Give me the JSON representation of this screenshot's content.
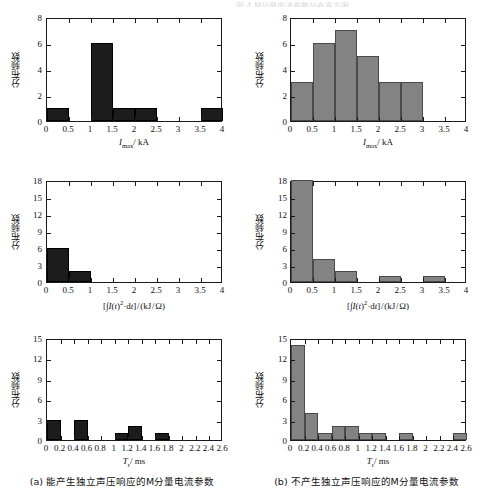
{
  "figure": {
    "top_cut_text": "图 4  M分量电流参数分布直方图",
    "caption_a": "(a) 能产生独立声压响应的M分量电流参数",
    "caption_b": "(b) 不产生独立声压响应的M分量电流参数",
    "ylabel_cn": "分布频数",
    "color_dark": "#1c1c1c",
    "color_gray": "#838383"
  },
  "chart_data": [
    {
      "id": "panel-top-left",
      "type": "bar",
      "title": "",
      "xlabel": "Imax/ kA",
      "xlabel_parts": {
        "sym": "I",
        "sub": "max",
        "unit": "/ kA"
      },
      "ylabel": "分布频数",
      "xlim": [
        0,
        4
      ],
      "ylim": [
        0,
        8
      ],
      "xticks": [
        0,
        0.5,
        1,
        1.5,
        2,
        2.5,
        3,
        3.5,
        4
      ],
      "xticklabels": [
        "0",
        "0.5",
        "1",
        "1.5",
        "2",
        "2.5",
        "3",
        "3.5",
        "4"
      ],
      "yticks": [
        0,
        2,
        4,
        6,
        8
      ],
      "yticklabels": [
        "0",
        "2",
        "4",
        "6",
        "8"
      ],
      "bin_width": 0.5,
      "bins": [
        0,
        0.5,
        1,
        1.5,
        2,
        2.5,
        3,
        3.5,
        4
      ],
      "values": [
        1,
        0,
        6,
        1,
        1,
        0,
        0,
        1
      ],
      "series_color": "#1c1c1c",
      "grid": false,
      "legend": "none"
    },
    {
      "id": "panel-top-right",
      "type": "bar",
      "title": "",
      "xlabel": "Imax/ kA",
      "xlabel_parts": {
        "sym": "I",
        "sub": "max",
        "unit": "/ kA"
      },
      "ylabel": "分布频数",
      "xlim": [
        0,
        4
      ],
      "ylim": [
        0,
        8
      ],
      "xticks": [
        0,
        0.5,
        1,
        1.5,
        2,
        2.5,
        3,
        3.5,
        4
      ],
      "xticklabels": [
        "0",
        "0.5",
        "1",
        "1.5",
        "2",
        "2.5",
        "3",
        "3.5",
        "4"
      ],
      "yticks": [
        0,
        2,
        4,
        6,
        8
      ],
      "yticklabels": [
        "0",
        "2",
        "4",
        "6",
        "8"
      ],
      "bin_width": 0.5,
      "bins": [
        0,
        0.5,
        1,
        1.5,
        2,
        2.5,
        3,
        3.5,
        4
      ],
      "values": [
        3,
        6,
        7,
        5,
        3,
        3,
        0,
        0
      ],
      "series_color": "#838383",
      "grid": false,
      "legend": "none"
    },
    {
      "id": "panel-mid-left",
      "type": "bar",
      "title": "",
      "xlabel": "[I(t)2·dt]/ (kJ/Ω)",
      "ylabel": "分布频数",
      "xlim": [
        0,
        4
      ],
      "ylim": [
        0,
        18
      ],
      "xticks": [
        0,
        0.5,
        1,
        1.5,
        2,
        2.5,
        3,
        3.5,
        4
      ],
      "xticklabels": [
        "0",
        "0.5",
        "1",
        "1.5",
        "2",
        "2.5",
        "3",
        "3.5",
        "4"
      ],
      "yticks": [
        0,
        3,
        6,
        9,
        12,
        15,
        18
      ],
      "yticklabels": [
        "0",
        "3",
        "6",
        "9",
        "12",
        "15",
        "18"
      ],
      "bin_width": 0.5,
      "bins": [
        0,
        0.5,
        1,
        1.5,
        2,
        2.5,
        3,
        3.5,
        4
      ],
      "values": [
        6,
        2,
        0,
        0,
        0,
        0,
        0,
        0
      ],
      "series_color": "#1c1c1c",
      "grid": false,
      "legend": "none"
    },
    {
      "id": "panel-mid-right",
      "type": "bar",
      "title": "",
      "xlabel": "[I(t)2·dt]/ (kJ/Ω)",
      "ylabel": "分布频数",
      "xlim": [
        0,
        4
      ],
      "ylim": [
        0,
        18
      ],
      "xticks": [
        0,
        0.5,
        1,
        1.5,
        2,
        2.5,
        3,
        3.5,
        4
      ],
      "xticklabels": [
        "0",
        "0.5",
        "1",
        "1.5",
        "2",
        "2.5",
        "3",
        "3.5",
        "4"
      ],
      "yticks": [
        0,
        3,
        6,
        9,
        12,
        15,
        18
      ],
      "yticklabels": [
        "0",
        "3",
        "6",
        "9",
        "12",
        "15",
        "18"
      ],
      "bin_width": 0.5,
      "bins": [
        0,
        0.5,
        1,
        1.5,
        2,
        2.5,
        3,
        3.5,
        4
      ],
      "values": [
        18,
        4,
        2,
        0,
        1,
        0,
        1,
        0
      ],
      "series_color": "#838383",
      "grid": false,
      "legend": "none"
    },
    {
      "id": "panel-bot-left",
      "type": "bar",
      "title": "",
      "xlabel": "Tr/ ms",
      "xlabel_parts": {
        "sym": "T",
        "sub": "r",
        "unit": "/ ms"
      },
      "ylabel": "分布频数",
      "xlim": [
        0,
        2.6
      ],
      "ylim": [
        0,
        15
      ],
      "xticks": [
        0,
        0.2,
        0.4,
        0.6,
        0.8,
        1,
        1.2,
        1.4,
        1.6,
        1.8,
        2,
        2.2,
        2.4,
        2.6
      ],
      "xticklabels": [
        "0",
        "0.2",
        "0.4",
        "0.6",
        "0.8",
        "1",
        "1.2",
        "1.4",
        "1.6",
        "1.8",
        "2",
        "2.2",
        "2.4",
        "2.6"
      ],
      "yticks": [
        0,
        3,
        6,
        9,
        12,
        15
      ],
      "yticklabels": [
        "0",
        "3",
        "6",
        "9",
        "12",
        "15"
      ],
      "bin_width": 0.2,
      "bins": [
        0,
        0.2,
        0.4,
        0.6,
        0.8,
        1,
        1.2,
        1.4,
        1.6,
        1.8,
        2,
        2.2,
        2.4,
        2.6
      ],
      "values": [
        3,
        0,
        3,
        0,
        0,
        1,
        2,
        0,
        1,
        0,
        0,
        0,
        0
      ],
      "series_color": "#1c1c1c",
      "grid": false,
      "legend": "none"
    },
    {
      "id": "panel-bot-right",
      "type": "bar",
      "title": "",
      "xlabel": "Tr/ ms",
      "xlabel_parts": {
        "sym": "T",
        "sub": "r",
        "unit": "/ ms"
      },
      "ylabel": "分布频数",
      "xlim": [
        0,
        2.6
      ],
      "ylim": [
        0,
        15
      ],
      "xticks": [
        0,
        0.2,
        0.4,
        0.6,
        0.8,
        1,
        1.2,
        1.4,
        1.6,
        1.8,
        2,
        2.2,
        2.4,
        2.6
      ],
      "xticklabels": [
        "0",
        "0.2",
        "0.4",
        "0.6",
        "0.8",
        "1",
        "1.2",
        "1.4",
        "1.6",
        "1.8",
        "2",
        "2.2",
        "2.4",
        "2.6"
      ],
      "yticks": [
        0,
        3,
        6,
        9,
        12,
        15
      ],
      "yticklabels": [
        "0",
        "3",
        "6",
        "9",
        "12",
        "15"
      ],
      "bin_width": 0.2,
      "bins": [
        0,
        0.2,
        0.4,
        0.6,
        0.8,
        1,
        1.2,
        1.4,
        1.6,
        1.8,
        2,
        2.2,
        2.4,
        2.6
      ],
      "values": [
        14,
        4,
        1,
        2,
        2,
        1,
        1,
        0,
        1,
        0,
        0,
        0,
        1
      ],
      "series_color": "#838383",
      "grid": false,
      "legend": "none"
    }
  ]
}
